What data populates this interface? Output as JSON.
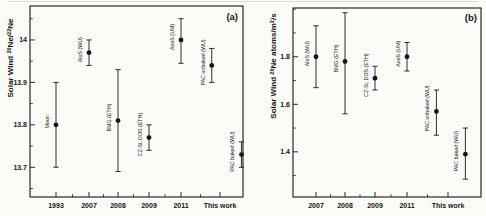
{
  "figure": {
    "panel_tags": [
      "(a)",
      "(b)"
    ]
  },
  "chart_data": [
    {
      "type": "scatter",
      "panel_tag": "(a)",
      "ylabel": "Solar Wind 20Ne/22Ne",
      "ylabel_parts": [
        {
          "t": "Solar Wind "
        },
        {
          "t": "20",
          "sup": true
        },
        {
          "t": "Ne/"
        },
        {
          "t": "22",
          "sup": true
        },
        {
          "t": "Ne"
        }
      ],
      "categories": [
        "1993",
        "2007",
        "2008",
        "2009",
        "2011",
        "This work"
      ],
      "ylim": [
        13.63,
        14.08
      ],
      "yticks": [
        {
          "v": 13.7,
          "label": "13.7"
        },
        {
          "v": 13.8,
          "label": "13.8"
        },
        {
          "v": 13.9,
          "label": "13.9"
        },
        {
          "v": 14.0,
          "label": "14"
        }
      ],
      "minor_step": 0.05,
      "grid": false,
      "points": [
        {
          "label": "Moon",
          "cat": 0,
          "off": 0,
          "value": 13.8,
          "lo": 13.7,
          "hi": 13.9
        },
        {
          "label": "AloS (WU)",
          "cat": 1,
          "off": 0,
          "value": 13.97,
          "lo": 13.94,
          "hi": 14.0
        },
        {
          "label": "BMG (ETH)",
          "cat": 2,
          "off": 0,
          "value": 13.81,
          "lo": 13.69,
          "hi": 13.93
        },
        {
          "label": "CZ-Si, DOS (ETH)",
          "cat": 3,
          "off": 0,
          "value": 13.77,
          "lo": 13.74,
          "hi": 13.8
        },
        {
          "label": "AuoS (UM)",
          "cat": 4,
          "off": 0,
          "value": 14.0,
          "lo": 13.945,
          "hi": 14.05
        },
        {
          "label": "PAC unbaked (WU)",
          "cat": 5,
          "off": -0.25,
          "value": 13.94,
          "lo": 13.9,
          "hi": 13.98
        },
        {
          "label": "PAC baked (WU)",
          "cat": 5,
          "off": 0.65,
          "value": 13.73,
          "lo": 13.7,
          "hi": 13.76
        }
      ]
    },
    {
      "type": "scatter",
      "panel_tag": "(b)",
      "ylabel": "Solar Wind 20Ne atoms/m2/s",
      "ylabel_parts": [
        {
          "t": "Solar Wind "
        },
        {
          "t": "20",
          "sup": true
        },
        {
          "t": "Ne atoms/m"
        },
        {
          "t": "2",
          "sup": true
        },
        {
          "t": "/s"
        }
      ],
      "categories": [
        "2007",
        "2008",
        "2009",
        "2011",
        "This work"
      ],
      "ylim": [
        1.21,
        2.005
      ],
      "yticks": [
        {
          "v": 1.4,
          "label": "1.4"
        },
        {
          "v": 1.6,
          "label": "1.6"
        },
        {
          "v": 1.8,
          "label": "1.8"
        }
      ],
      "minor_step": 0.1,
      "grid": false,
      "points": [
        {
          "label": "AloS (WU)",
          "cat": 0,
          "off": 0,
          "value": 1.8,
          "lo": 1.67,
          "hi": 1.93
        },
        {
          "label": "BMG (ETH)",
          "cat": 1,
          "off": 0,
          "value": 1.78,
          "lo": 1.56,
          "hi": 1.985
        },
        {
          "label": "CZ-Si, DOS (ETH)",
          "cat": 2,
          "off": 0,
          "value": 1.71,
          "lo": 1.66,
          "hi": 1.76
        },
        {
          "label": "AuoS (UM)",
          "cat": 3,
          "off": 0,
          "value": 1.8,
          "lo": 1.74,
          "hi": 1.86
        },
        {
          "label": "PAC unbaked (WU)",
          "cat": 4,
          "off": -0.4,
          "value": 1.57,
          "lo": 1.47,
          "hi": 1.66
        },
        {
          "label": "PAC baked (WU)",
          "cat": 4,
          "off": 0.6,
          "value": 1.39,
          "lo": 1.285,
          "hi": 1.5
        }
      ]
    }
  ]
}
